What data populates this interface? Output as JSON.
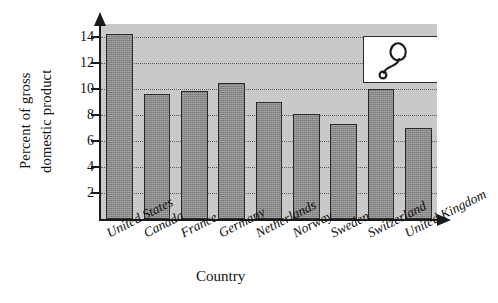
{
  "chart_data": {
    "type": "bar",
    "title": "",
    "subtitle": "",
    "xlabel": "Country",
    "ylabel": "Percent of gross domestic product",
    "ylabel_lines": [
      "Percent of gross",
      "domestic product"
    ],
    "categories": [
      "United States",
      "Canada",
      "France",
      "Germany",
      "Netherlands",
      "Norway",
      "Sweden",
      "Switzerland",
      "United Kingdom"
    ],
    "values": [
      14.2,
      9.65,
      9.85,
      10.5,
      9.0,
      8.1,
      7.3,
      10.0,
      7.0
    ],
    "ylim": [
      0,
      15
    ],
    "yticks": [
      2,
      4,
      6,
      8,
      10,
      12,
      14
    ],
    "ytick_labels": [
      "2",
      "4",
      "6",
      "8",
      "10",
      "12",
      "14"
    ],
    "grid": true,
    "grid_axis": "y",
    "legend": false,
    "legend_position": "none",
    "bar_color": "#8b8b8b",
    "bar_edge_color": "#2b2b2b",
    "plot_background": "#c9c9c9",
    "gridline_color": "#5c5c5c",
    "axis_color": "#1a1a1a"
  },
  "inset": {
    "icon": "stethoscope-icon",
    "background": "#ffffff",
    "border_color": "#2b2b2b"
  }
}
